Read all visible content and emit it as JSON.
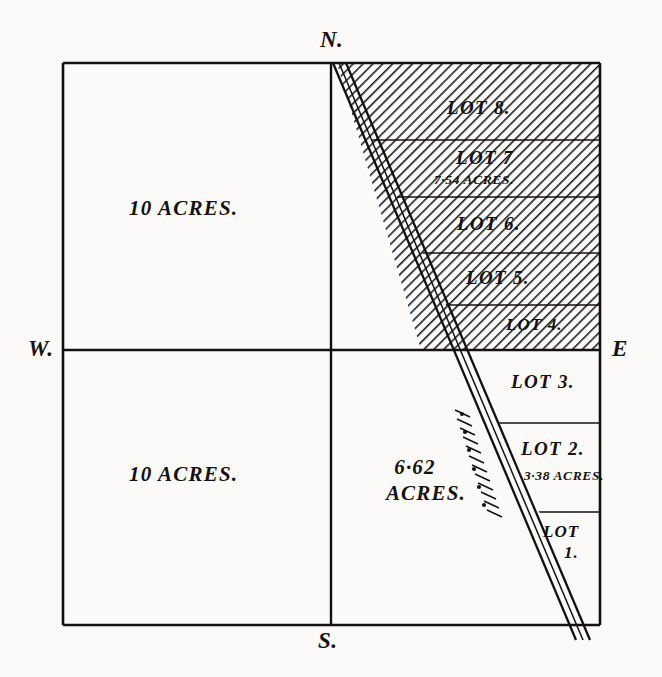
{
  "figure": {
    "kind": "plat-survey-diagram",
    "background_color": "#fbfaf8",
    "ink_color": "#14110f",
    "hatch_color": "#1a1a1a"
  },
  "compass": {
    "north": "N.",
    "south": "S.",
    "east": "E",
    "west": "W."
  },
  "parcels": [
    {
      "id": "nw-quadrant",
      "label": "10 ACRES.",
      "hatched": false
    },
    {
      "id": "sw-quadrant",
      "label": "10 ACRES.",
      "hatched": false
    },
    {
      "id": "sc-quadrant",
      "label_line1": "6·62",
      "label_line2": "ACRES.",
      "hatched": false
    }
  ],
  "lots": [
    {
      "name": "LOT 8.",
      "acres": "",
      "hatched": true
    },
    {
      "name": "LOT 7",
      "acres": "7·54 ACRES.",
      "hatched": true
    },
    {
      "name": "LOT 6.",
      "acres": "",
      "hatched": true
    },
    {
      "name": "LOT 5.",
      "acres": "",
      "hatched": true
    },
    {
      "name": "LOT 4.",
      "acres": "",
      "hatched": true
    },
    {
      "name": "LOT 3.",
      "acres": "",
      "hatched": false
    },
    {
      "name": "LOT 2.",
      "acres": "3·38 ACRES.",
      "hatched": false
    },
    {
      "name_line1": "LOT",
      "name_line2": "1.",
      "acres": "",
      "hatched": false
    }
  ]
}
